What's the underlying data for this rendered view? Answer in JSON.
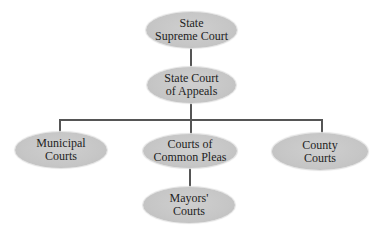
{
  "diagram": {
    "type": "org-chart",
    "title": "",
    "colors": {
      "node_fill": "#c8c8c8",
      "connector": "#555555",
      "text": "#1e1e1e",
      "background": "#ffffff"
    },
    "nodes": {
      "supreme": {
        "label": "State\nSupreme Court"
      },
      "appeals": {
        "label": "State Court\nof Appeals"
      },
      "municipal": {
        "label": "Municipal\nCourts"
      },
      "common_pleas": {
        "label": "Courts of\nCommon Pleas"
      },
      "county": {
        "label": "County\nCourts"
      },
      "mayors": {
        "label": "Mayors'\nCourts"
      }
    },
    "edges": [
      {
        "from": "State Supreme Court",
        "to": "State Court of Appeals"
      },
      {
        "from": "State Court of Appeals",
        "to": "Municipal Courts"
      },
      {
        "from": "State Court of Appeals",
        "to": "Courts of Common Pleas"
      },
      {
        "from": "State Court of Appeals",
        "to": "County Courts"
      },
      {
        "from": "Courts of Common Pleas",
        "to": "Mayors' Courts"
      }
    ]
  }
}
